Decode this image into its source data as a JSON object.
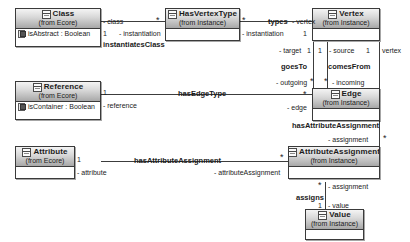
{
  "diagram": {
    "type": "uml-class-diagram",
    "classes": [
      {
        "id": "class",
        "name": "Class",
        "from": "(from Ecore)",
        "attributes": [
          "isAbstract : Boolean"
        ]
      },
      {
        "id": "hasvertextype",
        "name": "HasVertexType",
        "from": "(from Instance)",
        "attributes": []
      },
      {
        "id": "vertex",
        "name": "Vertex",
        "from": "(from Instance)",
        "attributes": []
      },
      {
        "id": "reference",
        "name": "Reference",
        "from": "(from Ecore)",
        "attributes": [
          "isContainer : Boolean"
        ]
      },
      {
        "id": "edge",
        "name": "Edge",
        "from": "(from Instance)",
        "attributes": []
      },
      {
        "id": "attribute",
        "name": "Attribute",
        "from": "(from Ecore)",
        "attributes": []
      },
      {
        "id": "attrassign",
        "name": "AttributeAssignment",
        "from": "(from Instance)",
        "attributes": []
      },
      {
        "id": "value",
        "name": "Value",
        "from": "(from Instance)",
        "attributes": []
      }
    ],
    "associations": [
      {
        "id": "instantiatesClass",
        "name": "instantiatesClass",
        "source": "Class",
        "target": "HasVertexType",
        "source_role": "- class",
        "source_mult": "1",
        "target_role": "- instantiation",
        "target_mult": "*"
      },
      {
        "id": "types",
        "name": "types",
        "source": "HasVertexType",
        "target": "Vertex",
        "source_role": "- instantiation",
        "source_mult": "*",
        "target_role": "- vertex",
        "target_mult": "1"
      },
      {
        "id": "goesTo",
        "name": "goesTo",
        "source": "Vertex",
        "target": "Edge",
        "source_role": "- target",
        "source_mult": "1",
        "target_role": "- outgoing",
        "target_mult": "*"
      },
      {
        "id": "comesFrom",
        "name": "comesFrom",
        "source": "Vertex",
        "target": "Edge",
        "source_role": "- source",
        "source_mult": "1",
        "target_role": "- incoming",
        "target_mult": "*"
      },
      {
        "id": "hasEdgeType",
        "name": "hasEdgeType",
        "source": "Reference",
        "target": "Edge",
        "source_role": "- reference",
        "source_mult": "1",
        "target_role": "- edge",
        "target_mult": "*"
      },
      {
        "id": "hasAttributeAssignmentEdge",
        "name": "hasAttributeAssignment",
        "source": "Edge",
        "target": "AttributeAssignment",
        "source_role": "- assignment",
        "source_mult": "*",
        "target_role": "",
        "target_mult": "*"
      },
      {
        "id": "hasAttributeAssignmentAttr",
        "name": "hasAttributeAssignment",
        "source": "Attribute",
        "target": "AttributeAssignment",
        "source_role": "- attribute",
        "source_mult": "1",
        "target_role": "- attributeAssignment",
        "target_mult": "*"
      },
      {
        "id": "assigns",
        "name": "assigns",
        "source": "AttributeAssignment",
        "target": "Value",
        "source_role": "- assignment",
        "source_mult": "*",
        "target_role": "- value",
        "target_mult": "1"
      }
    ],
    "labels": {
      "class_role": "- class",
      "one_a": "1",
      "star_a": "*",
      "instantiation_a": "- instantiation",
      "instantiatesClass": "instantiatesClass",
      "star_b": "*",
      "types": "types",
      "vertex_role": "- vertex",
      "instantiation_b": "- instantiation",
      "one_b": "1",
      "target_role": "- target",
      "one_c": "1",
      "one_d": "1",
      "source_role": "- source",
      "one_e": "1",
      "vertex_role2": "vertex",
      "goesTo": "goesTo",
      "comesFrom": "comesFrom",
      "outgoing_role": "- outgoing",
      "star_c": "*",
      "star_d": "*",
      "incoming_role": "- incoming",
      "one_f": "1",
      "hasEdgeType": "hasEdgeType",
      "reference_role": "- reference",
      "star_e": "*",
      "edge_role": "- edge",
      "hasAttributeAssignment_edge": "hasAttributeAssignment",
      "assignment_role_top": "- assignment",
      "star_f": "*",
      "star_g": "*",
      "one_g": "1",
      "hasAttributeAssignment_attr": "hasAttributeAssignment",
      "attribute_role": "- attribute",
      "attributeAssignment_role": "- attributeAssignment",
      "star_h": "*",
      "assignment_role_bottom": "- assignment",
      "star_i": "*",
      "assigns": "assigns",
      "one_h": "1",
      "value_role": "- value"
    },
    "colors": {
      "header_light": "#f4f4f4",
      "header_dark": "#a8a8a8",
      "border": "#3a3a3a",
      "line": "#3c3c3c",
      "background": "#ffffff",
      "text": "#1b1b1b"
    }
  }
}
